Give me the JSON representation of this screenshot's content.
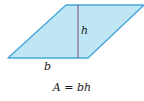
{
  "diagram": {
    "shape": "parallelogram",
    "fill_color": "#bfe6f5",
    "stroke_color": "#4aa8dc",
    "height_line_color": "#7a4a6a",
    "labels": {
      "height": "h",
      "base": "b"
    },
    "formula": {
      "lhs": "A",
      "equals": "=",
      "rhs": "bh"
    }
  }
}
